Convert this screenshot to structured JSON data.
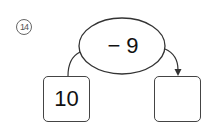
{
  "problem": {
    "number_label": "14",
    "operation": "− 9",
    "start_value": "10",
    "result_value": ""
  }
}
